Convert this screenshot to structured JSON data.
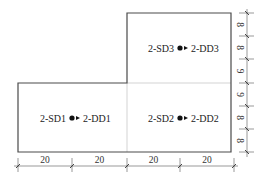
{
  "diagram": {
    "type": "floor-plan-sensor-layout",
    "colors": {
      "outline": "#4a4a4a",
      "grid": "#c8c8c8",
      "dimension": "#555555",
      "text": "#222222"
    },
    "markers": [
      {
        "id": "m1",
        "source": "2-SD1",
        "target": "2-DD1",
        "x": 72,
        "y": 118
      },
      {
        "id": "m2",
        "source": "2-SD2",
        "target": "2-DD2",
        "x": 180,
        "y": 118
      },
      {
        "id": "m3",
        "source": "2-SD3",
        "target": "2-DD3",
        "x": 180,
        "y": 48
      }
    ],
    "bottom_dimensions": [
      "20",
      "20",
      "20",
      "20"
    ],
    "right_dimensions": [
      "8",
      "8",
      "9",
      "9",
      "8",
      "8"
    ]
  }
}
